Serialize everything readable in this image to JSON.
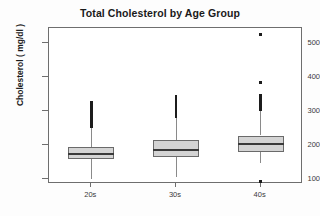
{
  "chart_data": {
    "type": "box",
    "title": "Total Cholesterol by Age Group",
    "xlabel": "",
    "ylabel": "Cholesterol ( mg/dl )",
    "categories": [
      "20s",
      "30s",
      "40s"
    ],
    "ylim": [
      85,
      545
    ],
    "yticks": [
      100,
      200,
      300,
      400,
      500
    ],
    "ytick_labels": [
      "100",
      "200",
      "300",
      "400",
      "500"
    ],
    "grid": false,
    "legend": "none",
    "series": [
      {
        "name": "20s",
        "whisker_low": 100,
        "q1": 160,
        "median": 175,
        "q3": 195,
        "whisker_high": 250,
        "outliers": [
          255,
          258,
          262,
          266,
          270,
          274,
          278,
          283,
          288,
          293,
          299,
          305,
          312,
          320,
          326
        ]
      },
      {
        "name": "30s",
        "whisker_low": 105,
        "q1": 165,
        "median": 188,
        "q3": 215,
        "whisker_high": 280,
        "outliers": [
          284,
          288,
          292,
          296,
          300,
          304,
          308,
          312,
          316,
          320,
          324,
          328,
          332,
          336,
          340,
          344
        ]
      },
      {
        "name": "40s",
        "whisker_low": 148,
        "q1": 178,
        "median": 205,
        "q3": 228,
        "whisker_high": 300,
        "outliers": [
          93,
          305,
          310,
          315,
          320,
          324,
          328,
          332,
          336,
          340,
          344,
          348,
          385,
          525
        ]
      }
    ]
  },
  "colors": {
    "box_fill": "#d4d4d4",
    "box_border": "#6a6a6a",
    "median": "#3a3a3a",
    "whisker": "#8a8a8a",
    "outlier": "#1c1c1c",
    "frame": "#6e6e6e",
    "text": "#1a1a1a"
  }
}
